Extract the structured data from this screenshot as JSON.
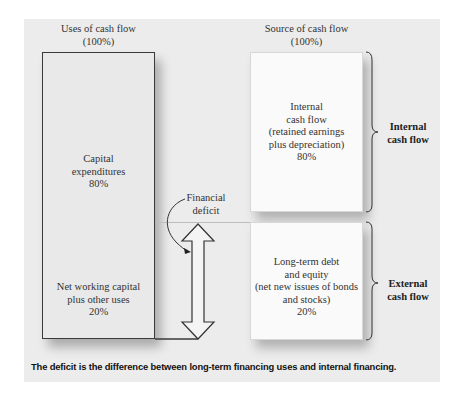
{
  "diagram": {
    "uses": {
      "title_line1": "Uses of cash flow",
      "title_line2": "(100%)",
      "capex": {
        "line1": "Capital",
        "line2": "expenditures",
        "pct": "80%"
      },
      "nwc": {
        "line1": "Net working capital",
        "line2": "plus other uses",
        "pct": "20%"
      }
    },
    "sources": {
      "title_line1": "Source of cash flow",
      "title_line2": "(100%)",
      "internal": {
        "line1": "Internal",
        "line2": "cash flow",
        "line3": "(retained earnings",
        "line4": "plus depreciation)",
        "pct": "80%"
      },
      "external": {
        "line1": "Long-term debt",
        "line2": "and equity",
        "line3": "(net new issues of bonds",
        "line4": "and stocks)",
        "pct": "20%"
      }
    },
    "brackets": {
      "internal": {
        "line1": "Internal",
        "line2": "cash flow"
      },
      "external": {
        "line1": "External",
        "line2": "cash flow"
      }
    },
    "deficit_label": {
      "line1": "Financial",
      "line2": "deficit"
    },
    "caption": "The deficit is the difference between long-term financing uses and internal financing.",
    "colors": {
      "panel": "#ececec",
      "box_border": "#3a3a3a",
      "source_box": "#fafafa"
    }
  }
}
